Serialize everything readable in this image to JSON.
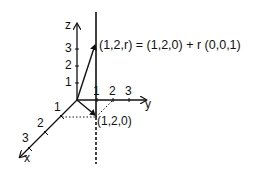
{
  "diagram": {
    "type": "3d-coordinate-line",
    "axes": {
      "x": {
        "label": "x",
        "ticks": [
          "1",
          "2",
          "3"
        ]
      },
      "y": {
        "label": "y",
        "ticks": [
          "1",
          "2",
          "3"
        ]
      },
      "z": {
        "label": "z",
        "ticks": [
          "1",
          "2",
          "3"
        ]
      }
    },
    "points": {
      "base": "(1,2,0)",
      "moving": "(1,2,r)"
    },
    "equation": "(1,2,r) = (1,2,0) + r (0,0,1)",
    "colors": {
      "ink": "#111111",
      "background": "#ffffff"
    }
  }
}
